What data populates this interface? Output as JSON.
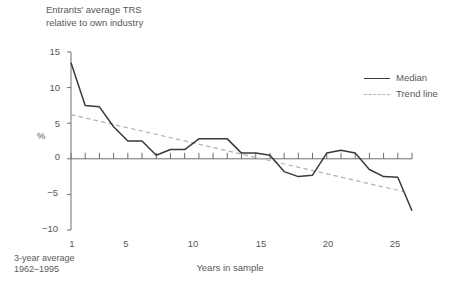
{
  "chart_data": {
    "type": "line",
    "title": "Entrants' average TRS\nrelative to own industry",
    "xlabel": "Years in sample",
    "ylabel": "%",
    "note": "3-year average\n  1962–1995",
    "xlim": [
      1,
      25
    ],
    "ylim": [
      -10,
      15
    ],
    "yticks": [
      15,
      10,
      5,
      0,
      -5,
      -10
    ],
    "xticks": [
      1,
      5,
      10,
      15,
      20,
      25
    ],
    "grid": false,
    "legend_position": "top-right",
    "x": [
      1,
      2,
      3,
      4,
      5,
      6,
      7,
      8,
      9,
      10,
      11,
      12,
      13,
      14,
      15,
      16,
      17,
      18,
      19,
      20,
      21,
      22,
      23,
      24,
      25
    ],
    "series": [
      {
        "name": "Median",
        "style": "solid",
        "color": "#3a3a3a",
        "values": [
          13.5,
          7.5,
          7.3,
          4.5,
          2.5,
          2.5,
          0.5,
          1.3,
          1.3,
          2.8,
          2.8,
          2.8,
          0.8,
          0.8,
          0.5,
          -1.8,
          -2.5,
          -2.3,
          0.8,
          1.2,
          0.8,
          -1.5,
          -2.5,
          -2.6,
          -7.3
        ]
      },
      {
        "name": "Trend line",
        "style": "dashed",
        "color": "#b2b2b2",
        "endpoints": [
          {
            "x": 1,
            "y": 6.2
          },
          {
            "x": 24.4,
            "y": -4.6
          }
        ]
      }
    ]
  },
  "axis_labels": {
    "y": [
      "15",
      "10",
      "5",
      "0",
      "−5",
      "−10"
    ],
    "x": [
      "1",
      "5",
      "10",
      "15",
      "20",
      "25"
    ]
  },
  "legend": {
    "items": [
      {
        "label": "Median"
      },
      {
        "label": "Trend line"
      }
    ]
  }
}
